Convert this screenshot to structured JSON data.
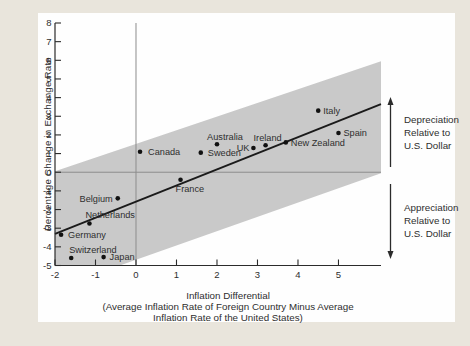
{
  "figure": {
    "background": "#e9e5dc",
    "panel_background": "#fefefe"
  },
  "chart_data": {
    "type": "scatter",
    "title": "",
    "xlabel": "Inflation Differential",
    "xlabel_note_line1": "(Average Inflation Rate of Foreign Country Minus Average",
    "xlabel_note_line2": "Inflation Rate of the United States)",
    "ylabel": "Percentage Change in Exchange Rate",
    "xlim": [
      -2,
      6.05
    ],
    "ylim": [
      -5,
      8
    ],
    "xticks": [
      -2,
      -1,
      0,
      1,
      2,
      3,
      4,
      5
    ],
    "yticks": [
      8,
      7,
      6,
      5,
      4,
      3,
      2,
      1,
      0,
      -1,
      -2,
      -3,
      -4,
      -5
    ],
    "grid": false,
    "reference_lines": {
      "vertical_x": 0,
      "horizontal_y": 0
    },
    "points": [
      {
        "name": "Canada",
        "x": 0.1,
        "y": 1.1,
        "label_side": "right",
        "label_dx": 3
      },
      {
        "name": "Sweden",
        "x": 1.6,
        "y": 1.05,
        "label_side": "right",
        "label_dx": 2
      },
      {
        "name": "Australia",
        "x": 2.0,
        "y": 1.5,
        "label_side": "above",
        "label_dx": 8
      },
      {
        "name": "UK",
        "x": 2.9,
        "y": 1.3,
        "label_side": "left",
        "label_dx": 1
      },
      {
        "name": "Ireland",
        "x": 3.2,
        "y": 1.45,
        "label_side": "above",
        "label_dx": 2
      },
      {
        "name": "New Zealand",
        "x": 3.7,
        "y": 1.6,
        "label_side": "right"
      },
      {
        "name": "Italy",
        "x": 4.5,
        "y": 3.3,
        "label_side": "right"
      },
      {
        "name": "Spain",
        "x": 5.0,
        "y": 2.1,
        "label_side": "right"
      },
      {
        "name": "France",
        "x": 1.1,
        "y": -0.4,
        "label_side": "below-start"
      },
      {
        "name": "Belgium",
        "x": -0.45,
        "y": -1.4,
        "label_side": "left"
      },
      {
        "name": "Netherlands",
        "x": -1.15,
        "y": -2.75,
        "label_side": "above-start",
        "label_dx": -4
      },
      {
        "name": "Germany",
        "x": -1.85,
        "y": -3.35,
        "label_side": "right",
        "label_dx": 2
      },
      {
        "name": "Switzerland",
        "x": -1.6,
        "y": -4.6,
        "label_side": "above-start",
        "label_dx": -2
      },
      {
        "name": "Japan",
        "x": -0.8,
        "y": -4.55,
        "label_side": "right",
        "label_dx": 1
      }
    ],
    "trend_line": {
      "x1": -2,
      "y1": -3.3,
      "x2": 6.05,
      "y2": 3.65
    },
    "band_polygon": [
      [
        -2,
        0.05
      ],
      [
        6.05,
        5.95
      ],
      [
        6.05,
        -0.05
      ],
      [
        -0.4,
        -5
      ],
      [
        -2,
        -5
      ]
    ],
    "annotations": [
      {
        "id": "depreciation",
        "arrow": "up",
        "lines": [
          "Depreciation",
          "Relative to",
          "U.S. Dollar"
        ]
      },
      {
        "id": "appreciation",
        "arrow": "down",
        "lines": [
          "Appreciation",
          "Relative to",
          "U.S. Dollar"
        ]
      }
    ],
    "colors": {
      "band": "#c9c9c9",
      "trend_line": "#1a1a1a",
      "point": "#111111",
      "reference_line": "#8c8c8c",
      "axis": "#2b2b2b",
      "text": "#2e2e2e"
    }
  }
}
